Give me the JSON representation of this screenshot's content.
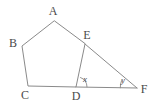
{
  "figure": {
    "type": "geometry-diagram",
    "background_color": "#ffffff",
    "stroke_color": "#8a8a8a",
    "label_color": "#4a4a4a",
    "stroke_width": 1,
    "vertices": [
      {
        "id": "A",
        "label": "A",
        "x": 54,
        "y": 21,
        "label_x": 53,
        "label_y": 11
      },
      {
        "id": "B",
        "label": "B",
        "x": 22,
        "y": 46,
        "label_x": 13,
        "label_y": 43
      },
      {
        "id": "C",
        "label": "C",
        "x": 28,
        "y": 86,
        "label_x": 25,
        "label_y": 95
      },
      {
        "id": "D",
        "label": "D",
        "x": 76,
        "y": 87,
        "label_x": 76,
        "label_y": 96
      },
      {
        "id": "E",
        "label": "E",
        "x": 85,
        "y": 44,
        "label_x": 87,
        "label_y": 35
      },
      {
        "id": "F",
        "label": "F",
        "x": 137,
        "y": 88,
        "label_x": 144,
        "label_y": 89
      }
    ],
    "pentagon_path": "M 54 21 L 22 46 L 28 86 L 76 87 L 85 44 Z",
    "segments": [
      {
        "name": "edge-AB",
        "from": "A",
        "to": "B"
      },
      {
        "name": "edge-BC",
        "from": "B",
        "to": "C"
      },
      {
        "name": "edge-CD",
        "from": "C",
        "to": "D"
      },
      {
        "name": "edge-DE",
        "from": "D",
        "to": "E"
      },
      {
        "name": "edge-EA",
        "from": "E",
        "to": "A"
      },
      {
        "name": "segment-EF",
        "from": "E",
        "to": "F"
      },
      {
        "name": "segment-DF",
        "from": "D",
        "to": "F"
      }
    ],
    "angles": [
      {
        "id": "x",
        "label": "x",
        "at_vertex": "D",
        "label_x": 85,
        "label_y": 79,
        "arc_path": "M 80.5 77.5 A 10 10 0 0 1 87 86.8"
      },
      {
        "id": "y",
        "label": "y",
        "at_vertex": "F",
        "label_x": 123,
        "label_y": 80,
        "arc_path": "M 121.5 80.7 A 17 17 0 0 0 120.3 87.8"
      }
    ]
  }
}
